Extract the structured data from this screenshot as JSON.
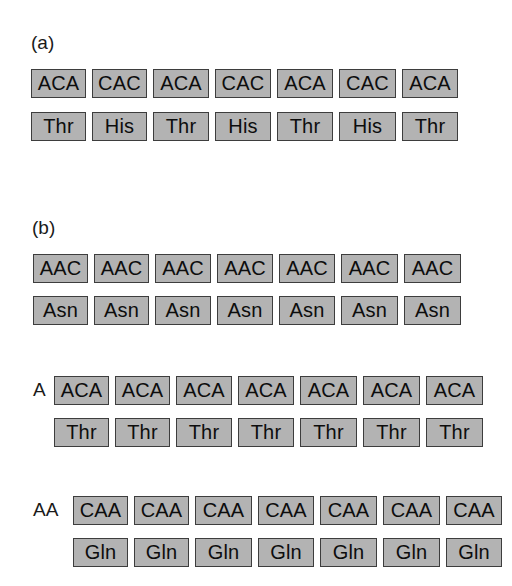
{
  "part_a": {
    "label": "(a)",
    "codon_row": [
      "ACA",
      "CAC",
      "ACA",
      "CAC",
      "ACA",
      "CAC",
      "ACA"
    ],
    "amino_row": [
      "Thr",
      "His",
      "Thr",
      "His",
      "Thr",
      "His",
      "Thr"
    ]
  },
  "part_b": {
    "label": "(b)",
    "frames": [
      {
        "prefix": "",
        "codon_row": [
          "AAC",
          "AAC",
          "AAC",
          "AAC",
          "AAC",
          "AAC",
          "AAC"
        ],
        "amino_row": [
          "Asn",
          "Asn",
          "Asn",
          "Asn",
          "Asn",
          "Asn",
          "Asn"
        ]
      },
      {
        "prefix": "A",
        "codon_row": [
          "ACA",
          "ACA",
          "ACA",
          "ACA",
          "ACA",
          "ACA",
          "ACA"
        ],
        "amino_row": [
          "Thr",
          "Thr",
          "Thr",
          "Thr",
          "Thr",
          "Thr",
          "Thr"
        ]
      },
      {
        "prefix": "AA",
        "codon_row": [
          "CAA",
          "CAA",
          "CAA",
          "CAA",
          "CAA",
          "CAA",
          "CAA"
        ],
        "amino_row": [
          "Gln",
          "Gln",
          "Gln",
          "Gln",
          "Gln",
          "Gln",
          "Gln"
        ]
      }
    ]
  },
  "colors": {
    "box_fill": "#b3b3b3",
    "box_border": "#3d3d3d",
    "text": "#0d0d0d",
    "background": "#ffffff"
  }
}
